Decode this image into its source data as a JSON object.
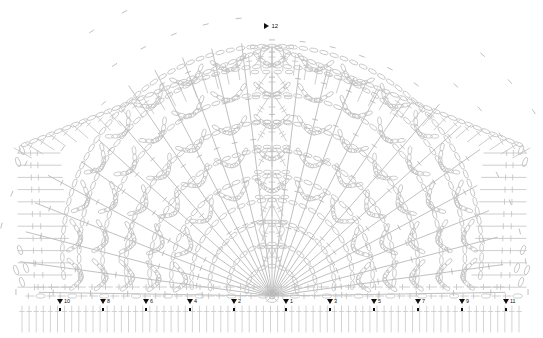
{
  "document": {
    "type": "crochet-pattern-chart",
    "title": "Crochet Shawl Stitch Diagram",
    "background_color": "#ffffff",
    "line_color": "#c2c2c2",
    "line_color_dark": "#b0b0b0",
    "marker_color": "#111111",
    "width": 543,
    "height": 338
  },
  "markers": {
    "apex": {
      "label": "12",
      "x": 268,
      "y": 26,
      "direction": "left"
    },
    "bottom": [
      {
        "label": "10",
        "x": 60,
        "y": 299,
        "direction": "up"
      },
      {
        "label": "8",
        "x": 103,
        "y": 299,
        "direction": "up"
      },
      {
        "label": "6",
        "x": 146,
        "y": 299,
        "direction": "up"
      },
      {
        "label": "4",
        "x": 190,
        "y": 299,
        "direction": "up"
      },
      {
        "label": "2",
        "x": 234,
        "y": 299,
        "direction": "up"
      },
      {
        "label": "1",
        "x": 286,
        "y": 299,
        "direction": "up"
      },
      {
        "label": "3",
        "x": 330,
        "y": 299,
        "direction": "up"
      },
      {
        "label": "5",
        "x": 374,
        "y": 299,
        "direction": "up"
      },
      {
        "label": "7",
        "x": 418,
        "y": 299,
        "direction": "up"
      },
      {
        "label": "9",
        "x": 462,
        "y": 299,
        "direction": "up"
      },
      {
        "label": "11",
        "x": 506,
        "y": 299,
        "direction": "up"
      }
    ]
  },
  "geometry": {
    "center_x": 272,
    "center_y": 296,
    "apex_x": 272,
    "apex_y": 46,
    "base_y": 296,
    "left_x": 14,
    "right_x": 530,
    "shoulder_y": 148,
    "fringe_top": 306,
    "fringe_bottom": 332,
    "rows": 12,
    "fan_rays": 26
  },
  "symbols": {
    "chain": "oval-loop",
    "double_crochet": "vertical-line-with-one-crossbar",
    "treble_crochet": "vertical-line-with-two-crossbars",
    "slip_stitch": "small-dot",
    "ray": "diagonal-line-with-crossbar"
  }
}
